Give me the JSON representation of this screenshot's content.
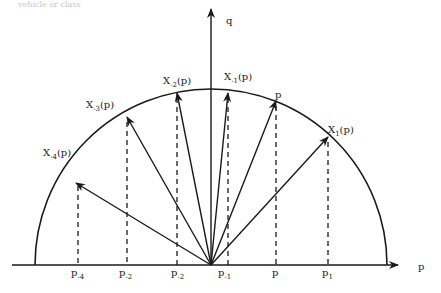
{
  "caption": "vehicle or class",
  "axes": {
    "horizontal_label": "p",
    "vertical_label": "q"
  },
  "vectors": [
    {
      "id": "x-4",
      "base": "X",
      "sub": "-4",
      "suffix": "(p)",
      "tip": [
        75,
        180
      ],
      "foot_label_base": "p",
      "foot_label_sub": "-4",
      "foot_x": 75
    },
    {
      "id": "x-3",
      "base": "X",
      "sub": "-3",
      "suffix": "(p)",
      "tip": [
        128,
        115
      ],
      "foot_label_base": "p",
      "foot_label_sub": "-2",
      "foot_x": 128
    },
    {
      "id": "x-2",
      "base": "X",
      "sub": "-2",
      "suffix": "(p)",
      "tip": [
        178,
        92
      ],
      "foot_label_base": "p",
      "foot_label_sub": "-2",
      "foot_x": 178
    },
    {
      "id": "x-1",
      "base": "X",
      "sub": "-1",
      "suffix": "(p)",
      "tip": [
        229,
        92
      ],
      "foot_label_base": "p",
      "foot_label_sub": "-1",
      "foot_x": 229
    },
    {
      "id": "p",
      "base": "p",
      "sub": "",
      "suffix": "",
      "tip": [
        276,
        100
      ],
      "foot_label_base": "p",
      "foot_label_sub": "",
      "foot_x": 276
    },
    {
      "id": "x1",
      "base": "X",
      "sub": "1",
      "suffix": "(p)",
      "tip": [
        328,
        136
      ],
      "foot_label_base": "p",
      "foot_label_sub": "1",
      "foot_x": 328
    }
  ],
  "labels": {
    "x_m4": {
      "base": "X",
      "sub": "-4",
      "suffix": "(p)"
    },
    "x_m3": {
      "base": "X",
      "sub": "-3",
      "suffix": "(p)"
    },
    "x_m2": {
      "base": "X",
      "sub": "-2",
      "suffix": "(p)"
    },
    "x_m1": {
      "base": "X",
      "sub": "-1",
      "suffix": "(p)"
    },
    "p_vec": {
      "base": "p"
    },
    "x_1": {
      "base": "X",
      "sub": "1",
      "suffix": "(p)"
    },
    "foot_m4": {
      "base": "p",
      "sub": "-4"
    },
    "foot_m3": {
      "base": "p",
      "sub": "-2"
    },
    "foot_m2": {
      "base": "p",
      "sub": "-2"
    },
    "foot_m1": {
      "base": "p",
      "sub": "-1"
    },
    "foot_p": {
      "base": "p"
    },
    "foot_1": {
      "base": "p",
      "sub": "1"
    }
  },
  "colors": {
    "ink": "#1a1a1a",
    "background": "#ffffff"
  }
}
